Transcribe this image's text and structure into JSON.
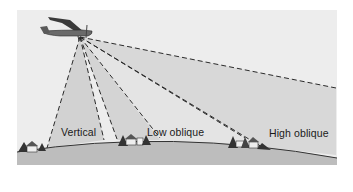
{
  "diagram": {
    "labels": {
      "vertical": "Vertical",
      "low_oblique": "Low oblique",
      "high_oblique": "High oblique"
    },
    "colors": {
      "sky": "#ececec",
      "cone": "#d6d6d6",
      "ground": "#bdbdbd",
      "horizon_line": "#333333",
      "dash": "#333333",
      "text": "#1a1a1a"
    }
  }
}
